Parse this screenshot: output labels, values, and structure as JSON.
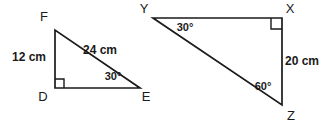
{
  "figure": {
    "stroke_color": "#1a1a1a",
    "background_color": "#ffffff",
    "triangles": [
      {
        "id": "triangle-def",
        "name": "Triangle DEF",
        "vertices": [
          {
            "label": "F",
            "x": 55,
            "y": 30,
            "label_x": 44,
            "label_y": 21
          },
          {
            "label": "D",
            "x": 55,
            "y": 88,
            "label_x": 43,
            "label_y": 101
          },
          {
            "label": "E",
            "x": 140,
            "y": 88,
            "label_x": 146,
            "label_y": 101
          }
        ],
        "right_angle_at": "D",
        "sides": [
          {
            "name": "DF",
            "label": "12 cm",
            "label_x": 29,
            "label_y": 61,
            "anchor": "middle"
          },
          {
            "name": "FE",
            "label": "24 cm",
            "label_x": 100,
            "label_y": 54,
            "anchor": "middle"
          }
        ],
        "angles": [
          {
            "at": "E",
            "label": "30°",
            "label_x": 113,
            "label_y": 80,
            "anchor": "middle"
          }
        ]
      },
      {
        "id": "triangle-xyz",
        "name": "Triangle XYZ",
        "vertices": [
          {
            "label": "Y",
            "x": 153,
            "y": 18,
            "label_x": 144,
            "label_y": 13
          },
          {
            "label": "X",
            "x": 282,
            "y": 18,
            "label_x": 290,
            "label_y": 13
          },
          {
            "label": "Z",
            "x": 282,
            "y": 105,
            "label_x": 291,
            "label_y": 120
          }
        ],
        "right_angle_at": "X",
        "sides": [
          {
            "name": "XZ",
            "label": "20 cm",
            "label_x": 302,
            "label_y": 65,
            "anchor": "middle"
          }
        ],
        "angles": [
          {
            "at": "Y",
            "label": "30°",
            "label_x": 185,
            "label_y": 31,
            "anchor": "middle"
          },
          {
            "at": "Z",
            "label": "60°",
            "label_x": 263,
            "label_y": 90,
            "anchor": "middle"
          }
        ]
      }
    ]
  }
}
